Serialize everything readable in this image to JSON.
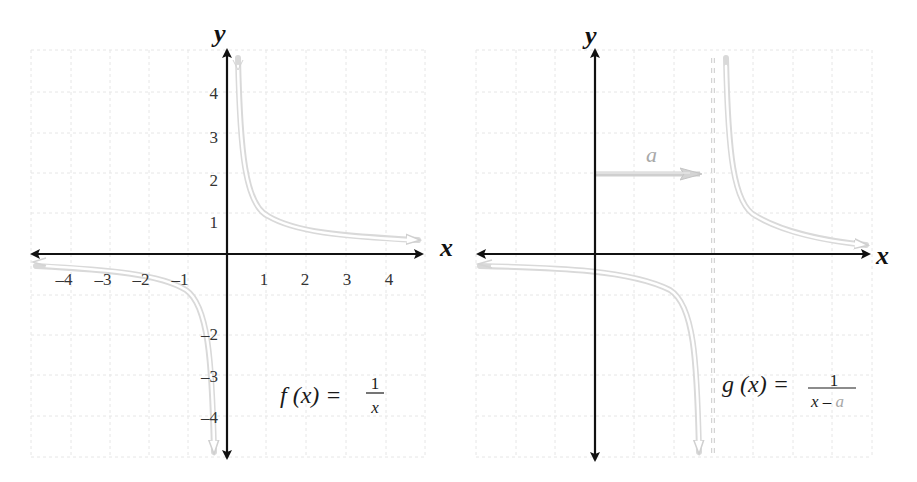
{
  "left_graph": {
    "x_axis_label": "x",
    "y_axis_label": "y",
    "x_tick_labels": [
      "–4",
      "–3",
      "–2",
      "–1",
      "1",
      "2",
      "3",
      "4"
    ],
    "y_tick_labels_positive": [
      "4",
      "3",
      "2",
      "1"
    ],
    "y_tick_labels_negative": [
      "–2",
      "–3",
      "–4"
    ],
    "formula": {
      "lhs": "f (x) =",
      "numerator": "1",
      "denominator": "x"
    },
    "curve": "y = 1/x",
    "vertical_asymptote": "x = 0"
  },
  "right_graph": {
    "x_axis_label": "x",
    "y_axis_label": "y",
    "shift_label": "a",
    "formula": {
      "lhs": "g (x) =",
      "numerator": "1",
      "denominator_x": "x –",
      "denominator_a": "a"
    },
    "curve": "y = 1/(x − a)",
    "vertical_asymptote": "x = a"
  },
  "colors": {
    "axis": "#111111",
    "grid": "#e6e6e6",
    "curve": "#d9d9d9",
    "shift_arrow": "#c8c8c8",
    "shift_label": "#a8a8a8"
  }
}
